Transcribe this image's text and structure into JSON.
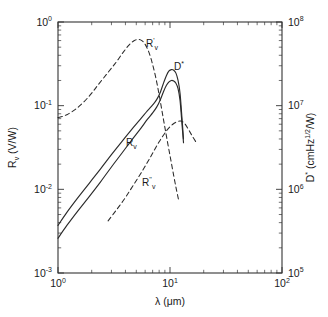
{
  "figure": {
    "background_color": "#ffffff",
    "line_color": "#2b2b2b",
    "axis_color": "#333333"
  },
  "axes": {
    "x": {
      "title_symbol": "λ",
      "title_units": "(μm)",
      "tick_labels": [
        {
          "mantissa": "10",
          "exponent": "0"
        },
        {
          "mantissa": "10",
          "exponent": "1"
        },
        {
          "mantissa": "10",
          "exponent": "2"
        }
      ]
    },
    "y_left": {
      "title_symbol": "R",
      "title_subscript": "v",
      "title_units": " (V/W)",
      "tick_labels": [
        {
          "mantissa": "10",
          "exponent": "0"
        },
        {
          "mantissa": "10",
          "exponent": "-1"
        },
        {
          "mantissa": "10",
          "exponent": "-2"
        },
        {
          "mantissa": "10",
          "exponent": "-3"
        }
      ]
    },
    "y_right": {
      "title_symbol": "D",
      "title_star": "*",
      "title_units": " (cmHz",
      "title_units_sup": "1/2",
      "title_units_tail": "/W)",
      "tick_labels": [
        {
          "mantissa": "10",
          "exponent": "8"
        },
        {
          "mantissa": "10",
          "exponent": "7"
        },
        {
          "mantissa": "10",
          "exponent": "6"
        },
        {
          "mantissa": "10",
          "exponent": "5"
        }
      ]
    }
  },
  "annotations": [
    {
      "id": "label-rv-prime",
      "base": "R",
      "prime": "'",
      "sub": "v",
      "x": 146,
      "y": 47
    },
    {
      "id": "label-dstar",
      "base": "D",
      "prime": "*",
      "sub": "",
      "x": 174,
      "y": 70
    },
    {
      "id": "label-rv",
      "base": "R",
      "prime": "",
      "sub": "v",
      "x": 126,
      "y": 146
    },
    {
      "id": "label-rv-doubleprime",
      "base": "R",
      "prime": "''",
      "sub": "v",
      "x": 142,
      "y": 186
    }
  ],
  "chart_data": {
    "type": "line",
    "title": "",
    "xlabel": "λ (μm)",
    "ylabel": "R_v (V/W)",
    "ylabel_right": "D* (cmHz^1/2/W)",
    "xscale": "log",
    "yscale": "log",
    "xlim": [
      1,
      100
    ],
    "ylim": [
      0.001,
      1
    ],
    "ylim_right": [
      100000,
      100000000
    ],
    "grid": false,
    "legend": "inline-annotations",
    "series": [
      {
        "name": "R_v",
        "style": "solid",
        "axis": "left",
        "comment": "lower solid curve, voltage responsivity",
        "x": [
          1.0,
          1.2,
          1.5,
          1.9,
          2.4,
          3.0,
          3.7,
          4.5,
          5.4,
          6.3,
          7.0,
          7.6,
          8.2,
          8.8,
          9.3,
          9.8,
          10.3,
          10.8,
          11.3,
          11.8,
          12.3,
          12.8,
          13.2
        ],
        "y": [
          0.0026,
          0.0037,
          0.0055,
          0.0082,
          0.0123,
          0.0185,
          0.0268,
          0.038,
          0.052,
          0.069,
          0.082,
          0.096,
          0.118,
          0.15,
          0.175,
          0.192,
          0.2,
          0.197,
          0.185,
          0.16,
          0.115,
          0.06,
          0.036
        ]
      },
      {
        "name": "D*",
        "style": "solid",
        "axis": "right",
        "comment": "upper solid curve, specific detectivity",
        "x": [
          1.0,
          1.2,
          1.5,
          1.9,
          2.4,
          3.0,
          3.7,
          4.5,
          5.4,
          6.3,
          7.0,
          7.6,
          8.2,
          8.8,
          9.3,
          9.8,
          10.3,
          10.8,
          11.3,
          11.8,
          12.3,
          12.8,
          13.2
        ],
        "y": [
          370000,
          530000,
          790000,
          1180000,
          1760000,
          2600000,
          3700000,
          5100000,
          6800000,
          8700000,
          10200000,
          11800000,
          14500000,
          19000000,
          23000000,
          26000000,
          27000000,
          26500000,
          24500000,
          20000000,
          14000000,
          7000000,
          4000000
        ]
      },
      {
        "name": "R'_v",
        "style": "dashed",
        "axis": "left",
        "comment": "dashed curve peaking near 5 um",
        "x": [
          1.0,
          1.2,
          1.5,
          1.9,
          2.3,
          2.8,
          3.3,
          3.8,
          4.3,
          4.8,
          5.2,
          5.6,
          6.0,
          6.5,
          7.0,
          7.5,
          8.0,
          8.5,
          9.0,
          9.6,
          10.2,
          10.8,
          11.4,
          12.0
        ],
        "y": [
          0.072,
          0.078,
          0.095,
          0.13,
          0.18,
          0.25,
          0.33,
          0.43,
          0.53,
          0.6,
          0.62,
          0.6,
          0.54,
          0.43,
          0.31,
          0.21,
          0.135,
          0.085,
          0.055,
          0.034,
          0.022,
          0.0145,
          0.01,
          0.0072
        ]
      },
      {
        "name": "R''_v",
        "style": "dashed",
        "axis": "left",
        "comment": "dashed curve rising from ~3 um to plateau near 12 um",
        "x": [
          2.8,
          3.3,
          3.9,
          4.5,
          5.2,
          5.9,
          6.6,
          7.3,
          8.0,
          8.7,
          9.4,
          10.0,
          10.6,
          11.2,
          11.8,
          12.4,
          13.0,
          13.8,
          14.6,
          15.4,
          16.2,
          17.0
        ],
        "y": [
          0.0042,
          0.0056,
          0.0076,
          0.0102,
          0.0138,
          0.0182,
          0.0235,
          0.03,
          0.037,
          0.044,
          0.051,
          0.056,
          0.06,
          0.063,
          0.065,
          0.0655,
          0.064,
          0.059,
          0.052,
          0.046,
          0.041,
          0.037
        ]
      }
    ]
  }
}
